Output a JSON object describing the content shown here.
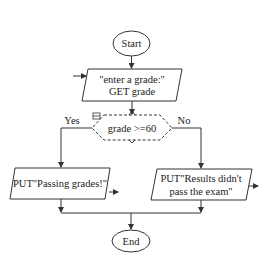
{
  "flowchart": {
    "start": {
      "label": "Start"
    },
    "input": {
      "line1": "\"enter a grade:\"",
      "line2": "GET grade"
    },
    "decision": {
      "condition": "grade >=60",
      "yes_label": "Yes",
      "no_label": "No"
    },
    "yes_output": {
      "line1": "PUT\"Passing grades!\""
    },
    "no_output": {
      "line1": "PUT\"Results didn't",
      "line2": "pass the exam\""
    },
    "end": {
      "label": "End"
    },
    "colors": {
      "stroke": "#333333",
      "background": "#ffffff",
      "text": "#222222"
    }
  }
}
